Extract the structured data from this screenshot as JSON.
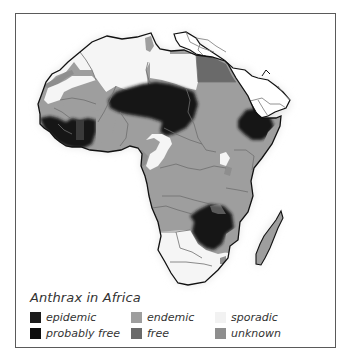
{
  "map": {
    "title": "Anthrax in Africa",
    "colors": {
      "epidemic": "#1c1c1c",
      "probably_free": "#0e0e0e",
      "endemic": "#9e9e9e",
      "free": "#6a6a6a",
      "sporadic": "#f2f2f2",
      "unknown": "#8e8e8e",
      "halo": "#e6e6e6",
      "border": "#111111",
      "inner_border": "#6e6e6e"
    }
  },
  "legend": {
    "items": [
      {
        "key": "epidemic",
        "label": "epidemic",
        "color": "#1c1c1c"
      },
      {
        "key": "endemic",
        "label": "endemic",
        "color": "#9e9e9e"
      },
      {
        "key": "sporadic",
        "label": "sporadic",
        "color": "#f2f2f2"
      },
      {
        "key": "probably_free",
        "label": "probably free",
        "color": "#0e0e0e"
      },
      {
        "key": "free",
        "label": "free",
        "color": "#6a6a6a"
      },
      {
        "key": "unknown",
        "label": "unknown",
        "color": "#8e8e8e"
      }
    ]
  }
}
